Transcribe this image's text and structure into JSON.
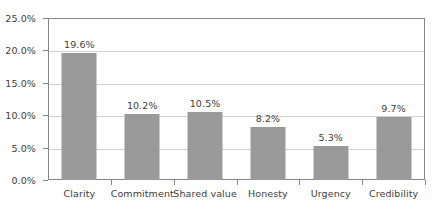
{
  "chart_data": {
    "type": "bar",
    "title": "",
    "subtitle": "",
    "xlabel": "",
    "ylabel": "",
    "categories": [
      "Clarity",
      "Commitment",
      "Shared value",
      "Honesty",
      "Urgency",
      "Credibility"
    ],
    "values": [
      19.6,
      10.2,
      10.5,
      8.2,
      5.3,
      9.7
    ],
    "value_labels": [
      "19.6%",
      "10.2%",
      "10.5%",
      "8.2%",
      "5.3%",
      "9.7%"
    ],
    "ylim": [
      0,
      25
    ],
    "ytick_values": [
      0,
      5,
      10,
      15,
      20,
      25
    ],
    "ytick_labels": [
      "0.0%",
      "5.0%",
      "10.0%",
      "15.0%",
      "20.0%",
      "25.0%"
    ],
    "grid": true,
    "grid_axis": "y",
    "legend": false,
    "legend_position": "none",
    "bar_color": "#9a9a9a",
    "gridline_color": "#d2d2d2",
    "axis_color": "#868686",
    "text_color": "#3d3d3d",
    "background_color": "#ffffff"
  }
}
